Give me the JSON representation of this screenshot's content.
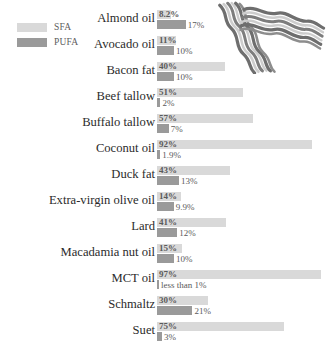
{
  "chart_data": {
    "type": "bar",
    "orientation": "horizontal",
    "title": "",
    "xlabel": "",
    "ylabel": "",
    "grid": false,
    "legend_position": "top-left",
    "xlim": [
      0,
      100
    ],
    "categories": [
      "Almond oil",
      "Avocado oil",
      "Bacon fat",
      "Beef tallow",
      "Buffalo tallow",
      "Coconut oil",
      "Duck fat",
      "Extra-virgin olive oil",
      "Lard",
      "Macadamia nut oil",
      "MCT oil",
      "Schmaltz",
      "Suet"
    ],
    "series": [
      {
        "name": "SFA",
        "color": "#d9d9d9",
        "values": [
          8.2,
          11,
          40,
          51,
          57,
          92,
          43,
          14,
          41,
          15,
          97,
          30,
          75
        ],
        "labels": [
          "8.2%",
          "11%",
          "40%",
          "51%",
          "57%",
          "92%",
          "43%",
          "14%",
          "41%",
          "15%",
          "97%",
          "30%",
          "75%"
        ]
      },
      {
        "name": "PUFA",
        "color": "#9a9a9a",
        "values": [
          17,
          10,
          10,
          2,
          7,
          1.9,
          13,
          9.9,
          12,
          10,
          0.9,
          21,
          3
        ],
        "labels": [
          "17%",
          "10%",
          "10%",
          "2%",
          "7%",
          "1.9%",
          "13%",
          "9.9%",
          "12%",
          "10%",
          "less than 1%",
          "21%",
          "3%"
        ]
      }
    ]
  },
  "legend": {
    "items": [
      {
        "label": "SFA",
        "color": "#d9d9d9"
      },
      {
        "label": "PUFA",
        "color": "#9a9a9a"
      }
    ]
  },
  "decoration": {
    "bacon_illustration": "bacon-strips"
  },
  "colors": {
    "sfa": "#d9d9d9",
    "pufa": "#9a9a9a",
    "label_text": "#2b2b2b",
    "value_text": "#5a5a5a",
    "legend_text": "#5d5d5d",
    "background": "#ffffff",
    "bacon_dark": "#6e6e6e",
    "bacon_light": "#c9c9c9"
  }
}
